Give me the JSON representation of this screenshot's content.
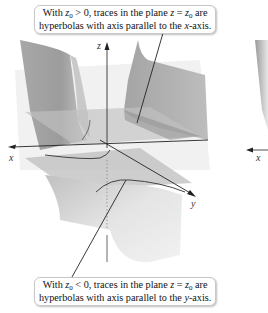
{
  "figure": {
    "callout_top": {
      "pre": "With ",
      "var": "z",
      "sub": "0",
      "cond": " > 0, traces in the plane ",
      "plane_var": "z",
      "eq": " = ",
      "plane_val": "z",
      "plane_sub": "0",
      "post": " are",
      "line2_pre": "hyperbolas with axis parallel to the ",
      "line2_axis": "x",
      "line2_post": "-axis."
    },
    "callout_bottom": {
      "pre": "With ",
      "var": "z",
      "sub": "0",
      "cond": " < 0, traces in the plane ",
      "plane_var": "z",
      "eq": " = ",
      "plane_val": "z",
      "plane_sub": "0",
      "post": " are",
      "line2_pre": "hyperbolas with axis parallel to the ",
      "line2_axis": "y",
      "line2_post": "-axis."
    },
    "axes": {
      "x": "x",
      "y": "y",
      "z": "z",
      "x_right_panel": "x"
    },
    "colors": {
      "surface_dark": "#9a9a9a",
      "surface_mid": "#b5b5b5",
      "surface_light": "#d6d6d6",
      "plane": "#c4c4c4",
      "axis": "#222222",
      "leader": "#222222"
    }
  }
}
